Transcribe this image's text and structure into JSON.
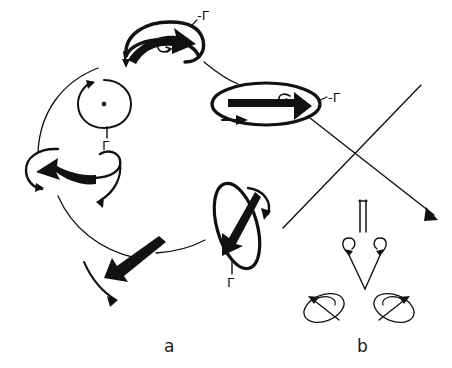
{
  "figure": {
    "background_color": "#ffffff",
    "ink_color": "#111111",
    "panels": [
      {
        "id": "a",
        "label": "a",
        "x": 168,
        "y": 338,
        "description": "cyclic sequence of vortex-tube circulation states"
      },
      {
        "id": "b",
        "label": "b",
        "x": 360,
        "y": 338,
        "description": "vortex pair splitting / reconnection states"
      }
    ]
  },
  "panel_a": {
    "elements": [
      {
        "name": "top-vortex-ring",
        "shape": "curved-ellipse",
        "circulation_label": "-Γ",
        "label_x": 197,
        "label_y": 18,
        "arrow_direction": "right",
        "arrow_thickness": "thick"
      },
      {
        "name": "circle-with-dot",
        "shape": "circle-with-center-dot",
        "circulation_label": "Γ",
        "label_x": 104,
        "label_y": 139,
        "arrow_direction": "counterclockwise",
        "arrow_thickness": "thin"
      },
      {
        "name": "left-vortex",
        "shape": "open-curl",
        "circulation_label": "",
        "arrow_direction": "left",
        "arrow_thickness": "thick"
      },
      {
        "name": "bottom-vortex",
        "shape": "open-arrow",
        "circulation_label": "",
        "arrow_direction": "down-left",
        "arrow_thickness": "thick"
      },
      {
        "name": "lower-right-vortex-ring",
        "shape": "tilted-ellipse",
        "circulation_label": "Γ",
        "label_x": 232,
        "label_y": 277,
        "arrow_direction": "down-left",
        "arrow_thickness": "thick"
      },
      {
        "name": "right-vortex-ring",
        "shape": "horizontal-ellipse",
        "circulation_label": "-Γ",
        "label_x": 331,
        "label_y": 98,
        "arrow_direction": "right",
        "arrow_thickness": "thick"
      }
    ],
    "cycle_connectors": [
      {
        "name": "connector-upper-left",
        "from": "circle-with-dot",
        "to": "top-vortex-ring"
      },
      {
        "name": "connector-left",
        "from": "left-vortex",
        "to": "circle-with-dot"
      },
      {
        "name": "connector-lower-left",
        "from": "bottom-vortex",
        "to": "left-vortex"
      },
      {
        "name": "connector-lower-right",
        "from": "lower-right-vortex-ring",
        "to": "bottom-vortex"
      },
      {
        "name": "connector-upper-right",
        "from": "top-vortex-ring",
        "to": "right-vortex-ring"
      }
    ]
  },
  "panel_b": {
    "elements": [
      {
        "name": "parallel-lines-symbol",
        "shape": "double-vertical-line"
      },
      {
        "name": "left-diverging-arrow",
        "shape": "thin-arrow-with-curl",
        "direction": "up-left"
      },
      {
        "name": "right-diverging-arrow",
        "shape": "thin-arrow-with-curl",
        "direction": "up-right"
      },
      {
        "name": "left-small-ellipse",
        "shape": "tilted-ellipse-with-arrow",
        "arrow_direction": "up-left"
      },
      {
        "name": "right-small-ellipse",
        "shape": "tilted-ellipse-with-arrow",
        "arrow_direction": "up-right"
      }
    ]
  },
  "cross_connectors": [
    {
      "name": "diagonal-arrow-down-right",
      "from_x": 310,
      "from_y": 118,
      "to_x": 437,
      "to_y": 219,
      "has_arrowhead": true
    },
    {
      "name": "diagonal-line-up-right",
      "from_x": 283,
      "from_y": 228,
      "to_x": 421,
      "to_y": 85,
      "has_arrowhead": false
    }
  ]
}
